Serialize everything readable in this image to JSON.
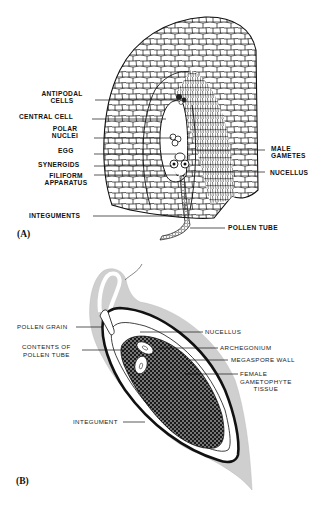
{
  "figure": {
    "panels": [
      {
        "id": "A",
        "panel_label": "(A)",
        "subject": "Angiosperm ovule section with embryo sac and entering pollen tube",
        "labels_left": [
          {
            "line1": "ANTIPODAL",
            "line2": "CELLS"
          },
          {
            "line1": "CENTRAL CELL"
          },
          {
            "line1": "POLAR",
            "line2": "NUCLEI"
          },
          {
            "line1": "EGG"
          },
          {
            "line1": "SYNERGIDS"
          },
          {
            "line1": "FILIFORM",
            "line2": "APPARATUS"
          },
          {
            "line1": "INTEGUMENTS"
          }
        ],
        "labels_right": [
          {
            "line1": "MALE",
            "line2": "GAMETES"
          },
          {
            "line1": "NUCELLUS"
          },
          {
            "line1": "POLLEN TUBE"
          }
        ]
      },
      {
        "id": "B",
        "panel_label": "(B)",
        "subject": "Gymnosperm ovule longitudinal section",
        "labels_left": [
          {
            "line1": "POLLEN GRAIN"
          },
          {
            "line1": "CONTENTS OF",
            "line2": "POLLEN TUBE"
          },
          {
            "line1": "INTEGUMENT"
          }
        ],
        "labels_right": [
          {
            "line1": "NUCELLUS"
          },
          {
            "line1": "ARCHEGONIUM"
          },
          {
            "line1": "MEGASPORE  WALL"
          },
          {
            "line1": "FEMALE",
            "line2": "GAMETOPHYTE",
            "line3": "TISSUE"
          }
        ]
      }
    ],
    "colors": {
      "ink": "#111111",
      "integument_fill": "#cfcfcf",
      "background": "#ffffff"
    }
  }
}
